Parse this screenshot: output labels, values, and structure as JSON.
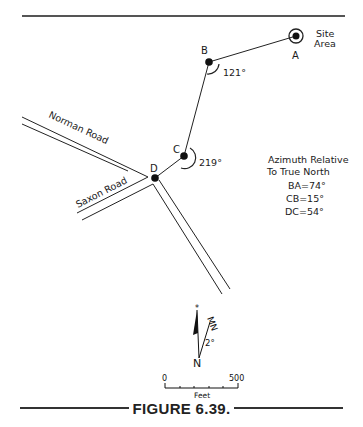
{
  "figure": {
    "caption": "FIGURE 6.39.",
    "points": {
      "A": {
        "label": "A"
      },
      "B": {
        "label": "B"
      },
      "C": {
        "label": "C"
      },
      "D": {
        "label": "D"
      }
    },
    "site_label_line1": "Site",
    "site_label_line2": "Area",
    "angles": {
      "B": "121°",
      "C": "219°"
    },
    "roads": {
      "norman": "Norman Road",
      "saxon": "Saxon Road"
    },
    "azimuth_box": {
      "title_line1": "Azimuth Relative",
      "title_line2": "To True North",
      "values": [
        "BA=74°",
        "CB=15°",
        "DC=54°"
      ]
    },
    "north_arrow": {
      "magnetic_label": "MN",
      "declination": "2°",
      "true_north_label": "N"
    },
    "scale_bar": {
      "start": "0",
      "end": "500",
      "unit": "Feet"
    }
  }
}
